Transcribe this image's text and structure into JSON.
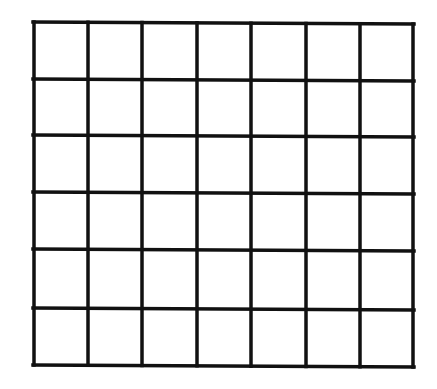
{
  "diagram": {
    "type": "empty-grid",
    "columns": 7,
    "rows": 6,
    "line_color": "#111111",
    "background_color": "#ffffff",
    "line_width": 3.5,
    "column_lines_x": [
      34,
      88,
      142,
      197,
      251,
      306,
      360,
      413
    ],
    "row_lines_y": [
      22,
      79,
      135,
      192,
      249,
      308,
      365
    ],
    "skew": {
      "top_right_dy": 2,
      "bottom_right_dy": 2
    }
  }
}
